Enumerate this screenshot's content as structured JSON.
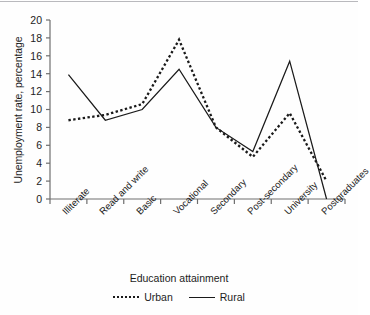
{
  "chart_data": {
    "type": "line",
    "title": "",
    "xlabel": "Education attainment",
    "ylabel": "Unemployment rate, percentage",
    "categories": [
      "Illiterate",
      "Read and write",
      "Basic",
      "Vocational",
      "Secondary",
      "Post-secondary",
      "University",
      "Postgraduates"
    ],
    "series": [
      {
        "name": "Urban",
        "style": "dotted",
        "values": [
          8.8,
          9.4,
          10.6,
          17.8,
          8.0,
          4.7,
          9.6,
          2.0
        ]
      },
      {
        "name": "Rural",
        "style": "solid",
        "values": [
          13.9,
          8.8,
          10.0,
          14.5,
          8.0,
          5.3,
          15.4,
          0.0
        ]
      }
    ],
    "ylim": [
      0,
      20
    ],
    "ytick_step": 2,
    "yticks": [
      "0",
      "2",
      "4",
      "6",
      "8",
      "10",
      "12",
      "14",
      "16",
      "18",
      "20"
    ],
    "grid": false,
    "legend_position": "bottom",
    "colors": {
      "line": "#1a1a1a",
      "axis": "#6e6e6e",
      "text": "#1c1c1c"
    }
  }
}
